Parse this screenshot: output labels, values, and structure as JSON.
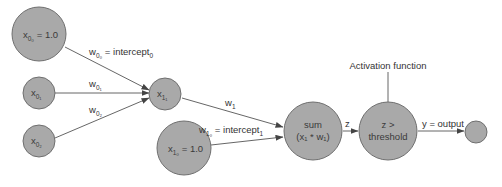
{
  "diagram": {
    "nodes": [
      {
        "id": "x00",
        "label": "x",
        "sub": "0₀",
        "suffix": " = 1.0"
      },
      {
        "id": "x01",
        "label": "x",
        "sub": "0₁",
        "suffix": ""
      },
      {
        "id": "x02",
        "label": "x",
        "sub": "0₂",
        "suffix": ""
      },
      {
        "id": "x11",
        "label": "x",
        "sub": "1₁",
        "suffix": ""
      },
      {
        "id": "x10",
        "label": "x",
        "sub": "1₀",
        "suffix": " = 1.0"
      },
      {
        "id": "sum",
        "line1": "sum",
        "line2": "(x₁ * w₁)"
      },
      {
        "id": "threshold",
        "line1": "z >",
        "line2": "threshold"
      },
      {
        "id": "output",
        "label": ""
      }
    ],
    "edges": [
      {
        "from": "x00",
        "to": "x11",
        "label": "w",
        "sub": "0₀",
        "suffix": " = intercept",
        "suffix_sub": "0"
      },
      {
        "from": "x01",
        "to": "x11",
        "label": "w",
        "sub": "0₁"
      },
      {
        "from": "x02",
        "to": "x11",
        "label": "w",
        "sub": "0₂"
      },
      {
        "from": "x11",
        "to": "sum",
        "label": "w",
        "sub": "1"
      },
      {
        "from": "x10",
        "to": "sum",
        "label": "w",
        "sub": "1₀",
        "suffix": " = intercept",
        "suffix_sub": "1"
      },
      {
        "from": "sum",
        "to": "threshold",
        "label": "z"
      },
      {
        "from": "threshold",
        "to": "output",
        "label": "y = output"
      }
    ],
    "annotation": "Activation function"
  }
}
